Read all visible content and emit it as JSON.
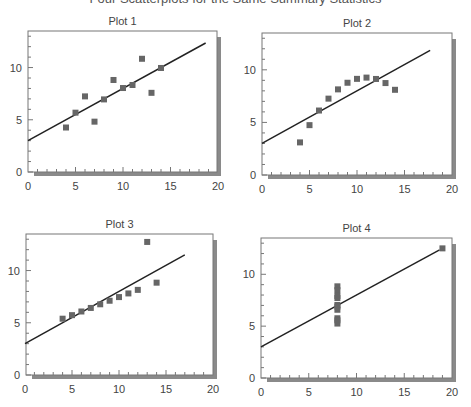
{
  "title": "Four Scatterplots for the Same Summary Statistics",
  "chart_data": [
    {
      "type": "scatter",
      "title": "Plot 1",
      "xlabel": "",
      "ylabel": "",
      "xlim": [
        0,
        20
      ],
      "ylim": [
        0,
        13.5
      ],
      "xticks": [
        0,
        5,
        10,
        15,
        20
      ],
      "yticks": [
        0,
        5,
        10
      ],
      "x": [
        10,
        8,
        13,
        9,
        11,
        14,
        6,
        4,
        12,
        7,
        5
      ],
      "y": [
        8.04,
        6.95,
        7.58,
        8.81,
        8.33,
        9.96,
        7.24,
        4.26,
        10.84,
        4.82,
        5.68
      ],
      "fit_line": {
        "intercept": 3.0,
        "slope": 0.5,
        "x_range": [
          0,
          18.7
        ]
      }
    },
    {
      "type": "scatter",
      "title": "Plot 2",
      "xlabel": "",
      "ylabel": "",
      "xlim": [
        0,
        20
      ],
      "ylim": [
        0,
        13.5
      ],
      "xticks": [
        0,
        5,
        10,
        15,
        20
      ],
      "yticks": [
        0,
        5,
        10
      ],
      "x": [
        10,
        8,
        13,
        9,
        11,
        14,
        6,
        4,
        12,
        7,
        5
      ],
      "y": [
        9.14,
        8.14,
        8.74,
        8.77,
        9.26,
        8.1,
        6.13,
        3.1,
        9.13,
        7.26,
        4.74
      ],
      "fit_line": {
        "intercept": 3.0,
        "slope": 0.5,
        "x_range": [
          0,
          17.7
        ]
      }
    },
    {
      "type": "scatter",
      "title": "Plot 3",
      "xlabel": "",
      "ylabel": "",
      "xlim": [
        0,
        20
      ],
      "ylim": [
        0,
        13.5
      ],
      "xticks": [
        0,
        5,
        10,
        15,
        20
      ],
      "yticks": [
        0,
        5,
        10
      ],
      "x": [
        10,
        8,
        13,
        9,
        11,
        14,
        6,
        4,
        12,
        7,
        5
      ],
      "y": [
        7.46,
        6.77,
        12.74,
        7.11,
        7.81,
        8.84,
        6.08,
        5.39,
        8.15,
        6.42,
        5.73
      ],
      "fit_line": {
        "intercept": 3.0,
        "slope": 0.5,
        "x_range": [
          0,
          17.0
        ]
      }
    },
    {
      "type": "scatter",
      "title": "Plot 4",
      "xlabel": "",
      "ylabel": "",
      "xlim": [
        0,
        20
      ],
      "ylim": [
        0,
        13.5
      ],
      "xticks": [
        0,
        5,
        10,
        15,
        20
      ],
      "yticks": [
        0,
        5,
        10
      ],
      "x": [
        8,
        8,
        8,
        8,
        8,
        8,
        8,
        19,
        8,
        8,
        8
      ],
      "y": [
        6.58,
        5.76,
        7.71,
        8.84,
        8.47,
        7.04,
        5.25,
        12.5,
        5.56,
        7.91,
        6.89
      ],
      "fit_line": {
        "intercept": 3.0,
        "slope": 0.5,
        "x_range": [
          0,
          18.7
        ]
      }
    }
  ]
}
